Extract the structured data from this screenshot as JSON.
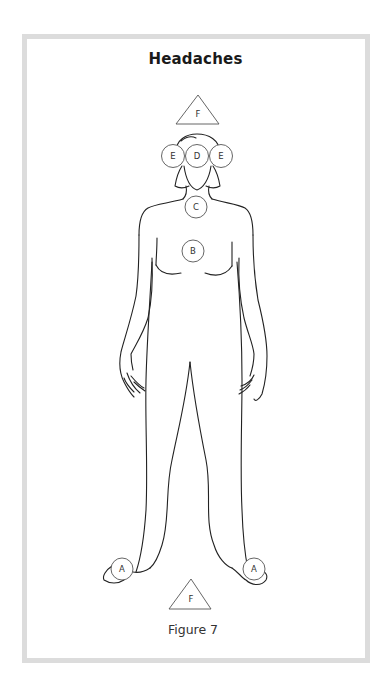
{
  "title": "Headaches",
  "caption": "Figure 7",
  "markers": {
    "F_top": {
      "shape": "triangle",
      "label": "F"
    },
    "E_left": {
      "shape": "circle",
      "label": "E"
    },
    "D": {
      "shape": "circle",
      "label": "D"
    },
    "E_right": {
      "shape": "circle",
      "label": "E"
    },
    "C": {
      "shape": "circle",
      "label": "C"
    },
    "B": {
      "shape": "circle",
      "label": "B"
    },
    "A_left": {
      "shape": "circle",
      "label": "A"
    },
    "A_right": {
      "shape": "circle",
      "label": "A"
    },
    "F_bottom": {
      "shape": "triangle",
      "label": "F"
    }
  },
  "colors": {
    "frame": "#dcdcdc",
    "line": "#222222",
    "marker": "#555555"
  }
}
